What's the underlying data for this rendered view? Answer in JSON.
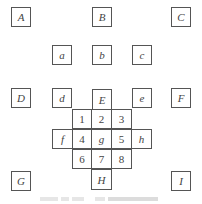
{
  "diagram": {
    "outer_boxes": [
      {
        "label": "A",
        "x": 11,
        "y": 7
      },
      {
        "label": "B",
        "x": 92,
        "y": 7
      },
      {
        "label": "C",
        "x": 171,
        "y": 7
      },
      {
        "label": "D",
        "x": 11,
        "y": 88
      },
      {
        "label": "F",
        "x": 171,
        "y": 88
      },
      {
        "label": "G",
        "x": 11,
        "y": 171
      },
      {
        "label": "I",
        "x": 171,
        "y": 171
      }
    ],
    "inner_boxes": [
      {
        "label": "a",
        "x": 52,
        "y": 45
      },
      {
        "label": "b",
        "x": 92,
        "y": 45
      },
      {
        "label": "c",
        "x": 132,
        "y": 45
      },
      {
        "label": "d",
        "x": 52,
        "y": 88
      },
      {
        "label": "e",
        "x": 132,
        "y": 88
      }
    ],
    "grid_cells": [
      {
        "label": "E",
        "x": 92,
        "y": 90,
        "italic": true
      },
      {
        "label": "1",
        "x": 72,
        "y": 110
      },
      {
        "label": "2",
        "x": 92,
        "y": 110
      },
      {
        "label": "3",
        "x": 112,
        "y": 110
      },
      {
        "label": "f",
        "x": 52,
        "y": 130,
        "italic": true
      },
      {
        "label": "4",
        "x": 72,
        "y": 130
      },
      {
        "label": "g",
        "x": 92,
        "y": 130,
        "italic": true
      },
      {
        "label": "5",
        "x": 112,
        "y": 130
      },
      {
        "label": "h",
        "x": 132,
        "y": 130,
        "italic": true
      },
      {
        "label": "6",
        "x": 72,
        "y": 150
      },
      {
        "label": "7",
        "x": 92,
        "y": 150
      },
      {
        "label": "8",
        "x": 112,
        "y": 150
      },
      {
        "label": "H",
        "x": 92,
        "y": 170,
        "italic": true
      }
    ]
  }
}
